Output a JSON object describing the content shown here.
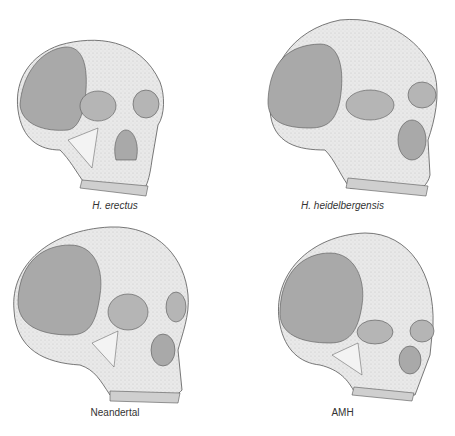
{
  "figure": {
    "colors": {
      "bone": "#e9e9e9",
      "stipple_dark": "#b9b9b9",
      "temporal_fossa": "#a9a9a9",
      "outline": "#555555",
      "teeth": "#cfcfcf",
      "label": "#333333"
    },
    "skulls": [
      {
        "id": "h-erectus",
        "label": "H. erectus",
        "italic": true
      },
      {
        "id": "h-heidelbergensis",
        "label": "H. heidelbergensis",
        "italic": true
      },
      {
        "id": "neandertal",
        "label": "Neandertal",
        "italic": false
      },
      {
        "id": "amh",
        "label": "AMH",
        "italic": false
      }
    ]
  }
}
